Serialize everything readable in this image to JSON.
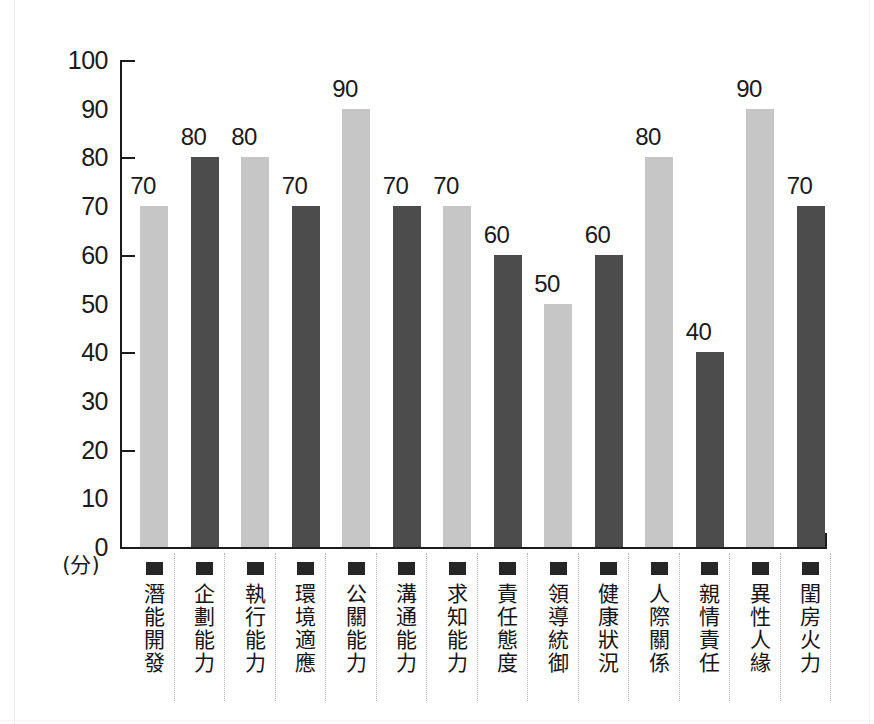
{
  "chart_data": {
    "type": "bar",
    "title": "",
    "subtitle": "",
    "xlabel": "",
    "ylabel": "(分)",
    "ylim": [
      0,
      100
    ],
    "grid": false,
    "legend": "none",
    "y_ticks": [
      100,
      90,
      80,
      70,
      60,
      50,
      40,
      30,
      20,
      10,
      0
    ],
    "y_major_ticks": [
      100,
      80,
      60,
      40,
      20,
      0
    ],
    "categories": [
      "潛能開發",
      "企劃能力",
      "執行能力",
      "環境適應",
      "公關能力",
      "溝通能力",
      "求知能力",
      "責任態度",
      "領導統御",
      "健康狀況",
      "人際關係",
      "親情責任",
      "異性人緣",
      "閨房火力"
    ],
    "values": [
      70,
      80,
      80,
      70,
      90,
      70,
      70,
      60,
      50,
      60,
      80,
      40,
      90,
      70
    ],
    "bar_colors": [
      "#c6c6c6",
      "#4c4c4c",
      "#c6c6c6",
      "#4c4c4c",
      "#c6c6c6",
      "#4c4c4c",
      "#c6c6c6",
      "#4c4c4c",
      "#c6c6c6",
      "#4c4c4c",
      "#c6c6c6",
      "#4c4c4c",
      "#c6c6c6",
      "#4c4c4c"
    ],
    "colors": {
      "light_bar": "#c6c6c6",
      "dark_bar": "#4c4c4c",
      "axis": "#1c1c1c",
      "text": "#1a1a1a",
      "divider": "#b4b4b4",
      "background": "#ffffff"
    }
  }
}
